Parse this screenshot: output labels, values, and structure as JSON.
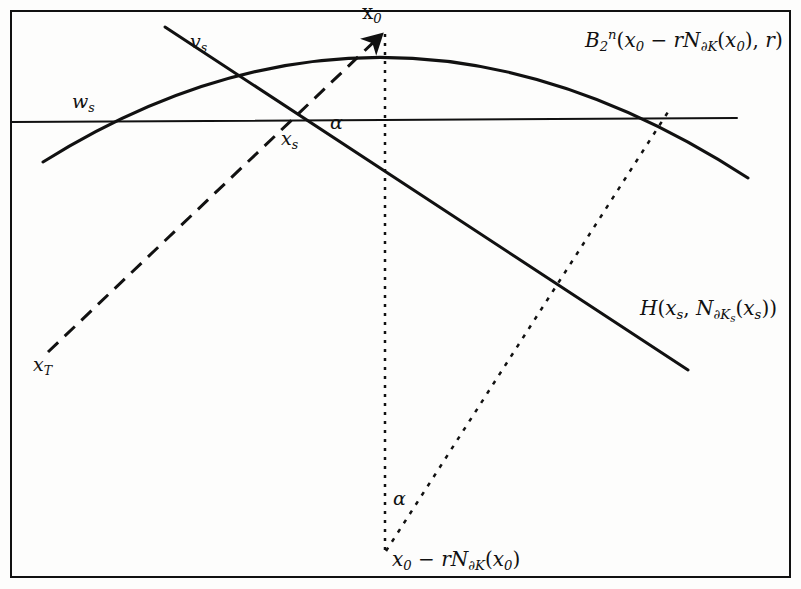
{
  "figure": {
    "background_color": "#fdfdfc",
    "ink_color": "#111111",
    "frame": {
      "x": 10,
      "y": 10,
      "width": 781,
      "height": 568
    }
  },
  "labels": {
    "x0": "x₀",
    "vs": "vₛ",
    "ws": "wₛ",
    "xs": "xₛ",
    "alpha_upper": "α",
    "alpha_lower": "α",
    "ball": "B₂ⁿ(x₀ − rN∂K(x₀), r)",
    "hyperplane": "H(xₛ, N∂Kₛ(xₛ))",
    "xT": "x_T",
    "base_point": "x₀ − rN∂K(x₀)"
  },
  "chart_data": {
    "type": "diagram",
    "coordinate_space": {
      "width": 801,
      "height": 589,
      "origin": "top-left"
    },
    "elements": [
      {
        "name": "frame-rectangle",
        "kind": "rect",
        "x": 10,
        "y": 10,
        "width": 781,
        "height": 568,
        "stroke": "#111111",
        "stroke_width": 2,
        "fill": "none"
      },
      {
        "name": "ball-boundary-arc",
        "kind": "arc",
        "label": "B₂ⁿ(x₀ − rN∂K(x₀), r)",
        "path": "M 43,162 Q 390,-55 748,178",
        "start": [
          43,
          162
        ],
        "apex": [
          383,
          33
        ],
        "end": [
          748,
          178
        ],
        "stroke": "#111111",
        "stroke_width": 3,
        "dash": "none"
      },
      {
        "name": "hyperplane-line",
        "kind": "line",
        "label": "H(xₛ, N∂Kₛ(xₛ))",
        "start": [
          165,
          27
        ],
        "end": [
          688,
          370
        ],
        "stroke": "#111111",
        "stroke_width": 3,
        "dash": "none"
      },
      {
        "name": "horizontal-line",
        "kind": "line",
        "start": [
          11,
          122
        ],
        "end": [
          737,
          118
        ],
        "stroke": "#111111",
        "stroke_width": 2,
        "dash": "none"
      },
      {
        "name": "dashed-ray-xT-to-x0",
        "kind": "line",
        "start": [
          48,
          352
        ],
        "end": [
          383,
          33
        ],
        "stroke": "#111111",
        "stroke_width": 3,
        "dash": "14,9",
        "arrowhead_at_end": true
      },
      {
        "name": "dotted-vertical-axis",
        "kind": "line",
        "start": [
          385,
          34
        ],
        "end": [
          385,
          551
        ],
        "stroke": "#111111",
        "stroke_width": 2.5,
        "dash": "3,6"
      },
      {
        "name": "dotted-ray-base-to-arc",
        "kind": "line",
        "start": [
          386,
          551
        ],
        "end": [
          668,
          112
        ],
        "stroke": "#111111",
        "stroke_width": 2.5,
        "dash": "4,7"
      }
    ],
    "marked_points": [
      {
        "name": "x0",
        "label": "x₀",
        "x": 383,
        "y": 33
      },
      {
        "name": "xs",
        "label": "xₛ",
        "x": 295,
        "y": 121
      },
      {
        "name": "ws",
        "label": "wₛ",
        "x": 98,
        "y": 122
      },
      {
        "name": "vs",
        "label": "vₛ",
        "x": 213,
        "y": 62
      },
      {
        "name": "xT",
        "label": "x_T",
        "x": 48,
        "y": 352
      },
      {
        "name": "base",
        "label": "x₀ − rN∂K(x₀)",
        "x": 385,
        "y": 551
      },
      {
        "name": "arc-cross",
        "label": "",
        "x": 673,
        "y": 118
      }
    ],
    "angles": [
      {
        "name": "alpha-upper",
        "label": "α",
        "vertex": [
          295,
          121
        ],
        "x": 340,
        "y": 128
      },
      {
        "name": "alpha-lower",
        "label": "α",
        "vertex": [
          385,
          551
        ],
        "x": 398,
        "y": 500
      }
    ]
  }
}
